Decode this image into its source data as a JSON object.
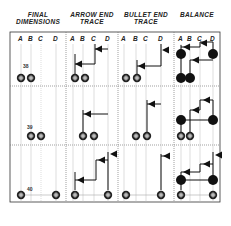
{
  "headers": [
    {
      "label": "FINAL\nDIMENSIONS"
    },
    {
      "label": "ARROW END\nTRACE"
    },
    {
      "label": "BULLET END\nTRACE"
    },
    {
      "label": "BALANCE"
    }
  ],
  "sub_columns": [
    "A",
    "B",
    "C",
    "D"
  ],
  "rows": [
    {
      "label": "38"
    },
    {
      "label": "39"
    },
    {
      "label": "40"
    }
  ],
  "colors": {
    "ink": "#111111",
    "grid": "#999999",
    "background": "#ffffff"
  }
}
